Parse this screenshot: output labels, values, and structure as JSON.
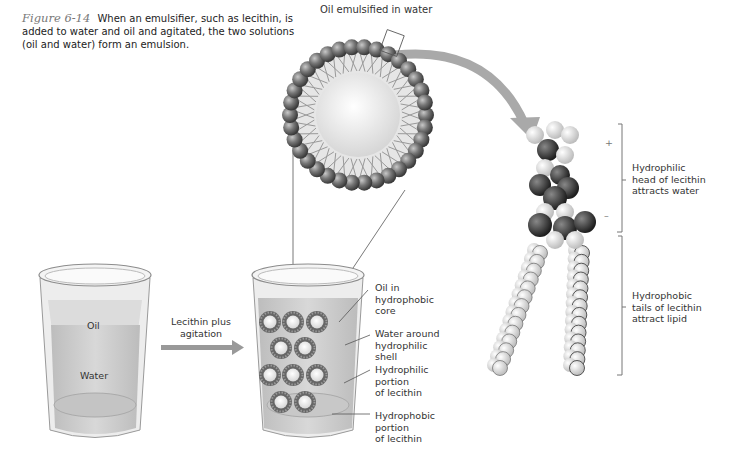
{
  "caption": {
    "figure_number": "Figure 6-14",
    "text": "When an emulsifier, such as lecithin, is added to water and oil and agitated, the two solutions (oil and water) form an emulsion."
  },
  "droplet": {
    "title": "Oil emulsified in water"
  },
  "beaker_left": {
    "oil_label": "Oil",
    "water_label": "Water"
  },
  "arrow": {
    "label_line1": "Lecithin plus",
    "label_line2": "agitation"
  },
  "beaker_right": {
    "callouts": [
      {
        "lines": [
          "Oil in",
          "hydrophobic",
          "core"
        ]
      },
      {
        "lines": [
          "Water around",
          "hydrophilic",
          "shell"
        ]
      },
      {
        "lines": [
          "Hydrophilic",
          "portion",
          "of lecithin"
        ]
      },
      {
        "lines": [
          "Hydrophobic",
          "portion",
          "of lecithin"
        ]
      }
    ]
  },
  "molecule": {
    "plus_sign": "+",
    "minus_sign": "–",
    "head_label": [
      "Hydrophilic",
      "head of lecithin",
      "attracts water"
    ],
    "tail_label": [
      "Hydrophobic",
      "tails of lecithin",
      "attract lipid"
    ]
  },
  "colors": {
    "arrow": "#9a9a9a",
    "sphere_dark": "#555555",
    "oil_core": "#eeeeee",
    "liquid": "#cfcfcf"
  }
}
